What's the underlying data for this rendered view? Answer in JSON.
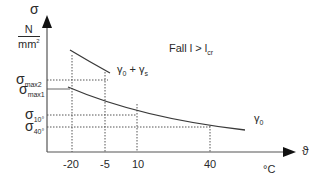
{
  "diagram": {
    "title_annotation": "Fall l > l",
    "title_annotation_sub": "cr",
    "y_axis": {
      "symbol": "σ",
      "unit_numerator": "N",
      "unit_denominator": "mm",
      "unit_denominator_exp": "2"
    },
    "x_axis": {
      "symbol": "ϑ",
      "unit": "°C",
      "ticks": [
        "-20",
        "-5",
        "10",
        "40"
      ]
    },
    "y_levels": [
      {
        "base": "σ",
        "sub": "max2"
      },
      {
        "base": "σ",
        "sub": "max1"
      },
      {
        "base": "σ",
        "sub": "10°"
      },
      {
        "base": "σ",
        "sub": "40°"
      }
    ],
    "curves": [
      {
        "label": "γ",
        "label_sub": "0",
        "label_suffix": " + γ",
        "label_suffix_sub": "s"
      },
      {
        "label": "γ",
        "label_sub": "0"
      }
    ],
    "colors": {
      "line": "#3a3a3a",
      "guide": "#555555",
      "background": "#ffffff"
    }
  }
}
